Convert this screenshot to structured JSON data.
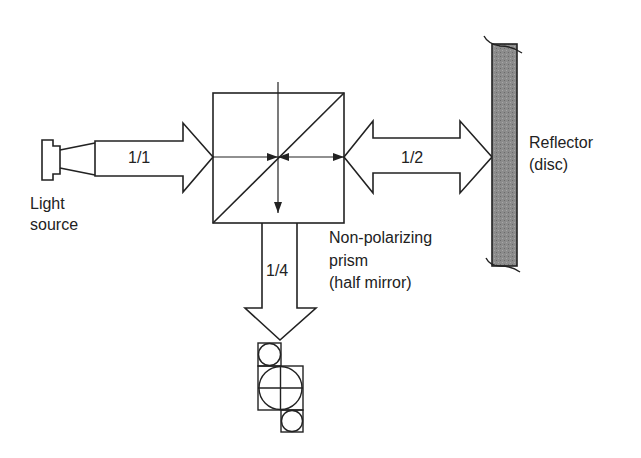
{
  "diagram": {
    "type": "optical-pickup-schematic",
    "components": {
      "light_source": {
        "label_line1": "Light",
        "label_line2": "source"
      },
      "prism": {
        "label_line1": "Non-polarizing",
        "label_line2": "prism",
        "label_line3": "(half mirror)"
      },
      "reflector": {
        "label_line1": "Reflector",
        "label_line2": "(disc)"
      },
      "detector": {
        "label": ""
      }
    },
    "beams": {
      "incident": {
        "label": "1/1"
      },
      "to_disc": {
        "label": "1/2"
      },
      "to_detector": {
        "label": "1/4"
      }
    },
    "colors": {
      "line": "#222222",
      "reflector_fill": "#8a8a8a",
      "background": "#ffffff"
    }
  }
}
